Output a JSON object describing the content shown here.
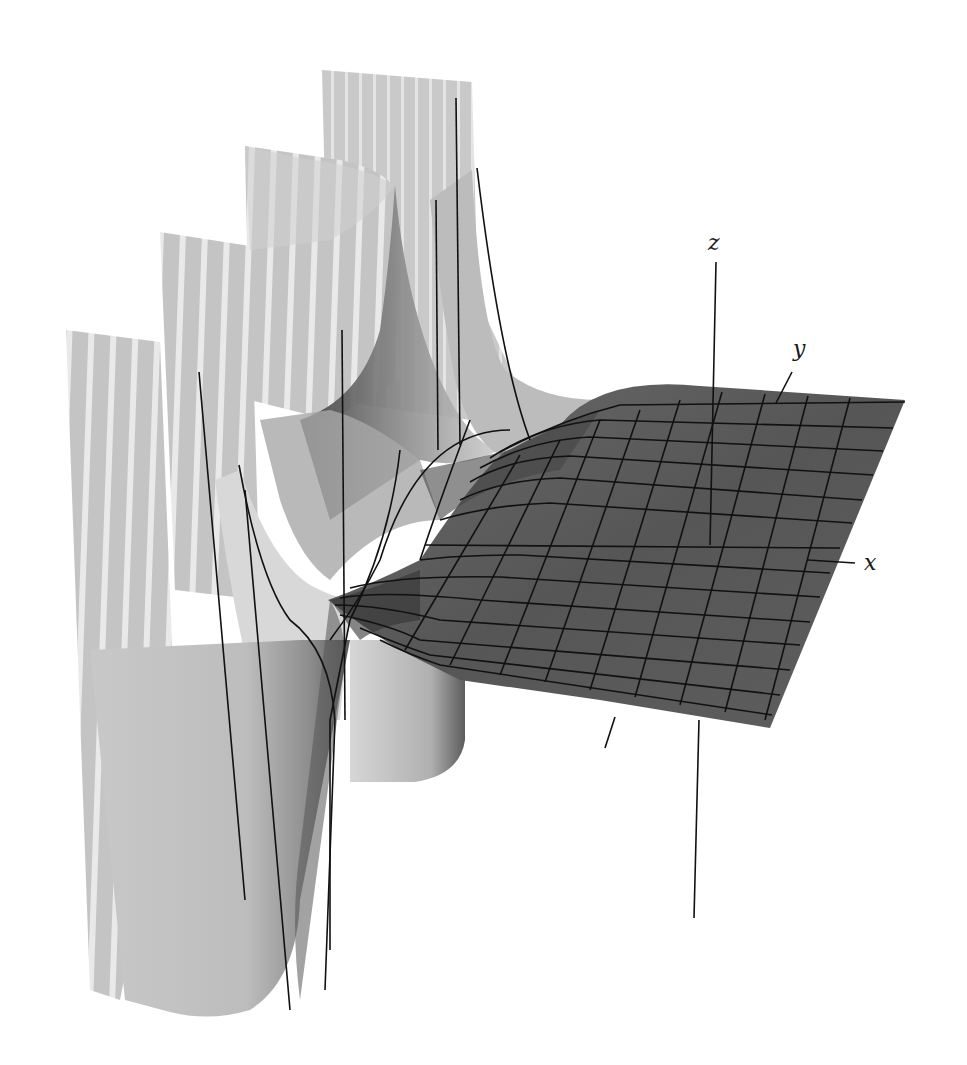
{
  "figure": {
    "axes": {
      "x_label": "x",
      "y_label": "y",
      "z_label": "z"
    },
    "colors": {
      "background": "#ffffff",
      "plane_fill": "#5a5a5a",
      "plane_dark": "#4a4a4a",
      "sheet_light": "#d4d4d4",
      "sheet_mid": "#bdbdbd",
      "sheet_stripe": "#e8e8e8",
      "funnel_dark": "#3a3a3a",
      "grid_line": "#111111"
    }
  }
}
